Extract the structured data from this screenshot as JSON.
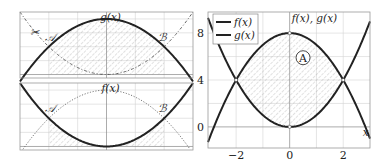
{
  "chart_data": [
    {
      "type": "line",
      "panel": "top-left",
      "title": "g(x)",
      "series": [
        {
          "name": "g(x)",
          "formula": "8 - x^2",
          "style": "bold"
        },
        {
          "name": "f(x)",
          "formula": "x^2",
          "style": "dash-dot"
        }
      ],
      "xlim": [
        -3,
        3
      ],
      "ylim": [
        -0.5,
        9
      ],
      "shaded_region": {
        "x": [
          -2,
          2
        ],
        "under": "g(x)"
      },
      "annotations": [
        "𝒜",
        "ℬ",
        "✂"
      ],
      "grid": true
    },
    {
      "type": "line",
      "panel": "bottom-left",
      "title": "f(x)",
      "series": [
        {
          "name": "f(x)",
          "formula": "x^2",
          "style": "bold"
        },
        {
          "name": "g(x)",
          "formula": "8 - x^2",
          "style": "dotted"
        }
      ],
      "xlim": [
        -3,
        3
      ],
      "ylim": [
        -0.5,
        9
      ],
      "shaded_region": {
        "x": [
          -2,
          2
        ],
        "under": "f(x)"
      },
      "annotations": [
        "𝒜",
        "ℬ"
      ],
      "grid": true
    },
    {
      "type": "line",
      "panel": "right",
      "title": "f(x), g(x)",
      "xlabel": "x",
      "series": [
        {
          "name": "f(x)",
          "formula": "x^2"
        },
        {
          "name": "g(x)",
          "formula": "8 - x^2"
        }
      ],
      "xlim": [
        -3.05,
        3.0
      ],
      "ylim": [
        -1.8,
        9.8
      ],
      "xticks": [
        -2,
        0,
        2
      ],
      "xtick_labels": [
        "−2",
        "0",
        "2"
      ],
      "yticks": [
        0,
        4,
        8
      ],
      "ytick_labels": [
        "0",
        "4",
        "8"
      ],
      "intersections": [
        [
          -2,
          4
        ],
        [
          2,
          4
        ],
        [
          0,
          0
        ],
        [
          0,
          8
        ]
      ],
      "shaded_region": {
        "x": [
          -2,
          2
        ],
        "between": [
          "f(x)",
          "g(x)"
        ]
      },
      "region_label": "A",
      "legend": {
        "position": "top-left",
        "entries": [
          "f(x)",
          "g(x)"
        ]
      },
      "grid": true
    }
  ],
  "labels": {
    "top_title": "g(x)",
    "bottom_title": "f(x)",
    "right_title": "f(x), g(x)",
    "point_a": "𝒜",
    "point_b": "ℬ",
    "scissors": "✂",
    "region": "A",
    "x_axis": "x",
    "legend_f": "f(x)",
    "legend_g": "g(x)"
  }
}
